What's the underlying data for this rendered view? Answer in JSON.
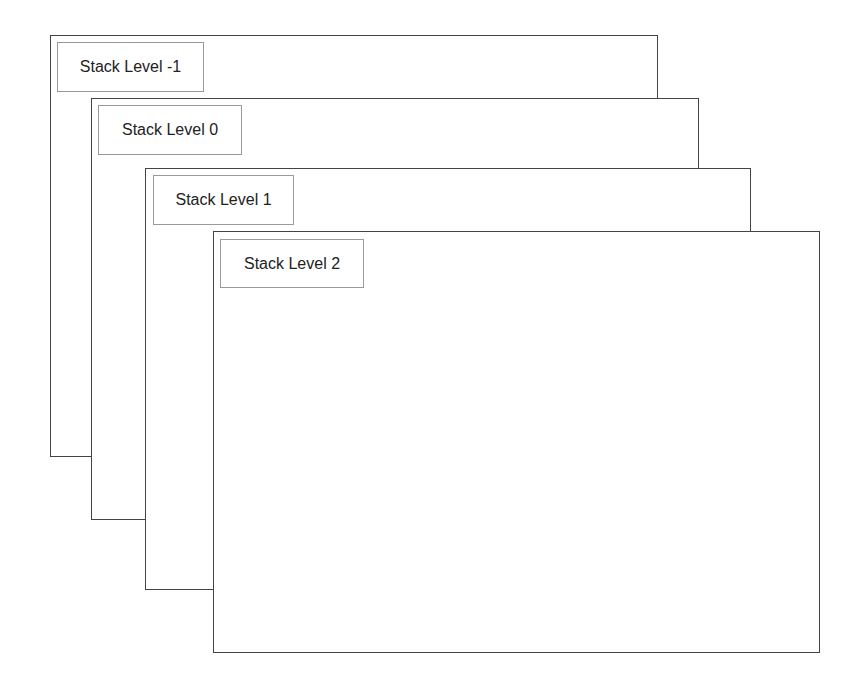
{
  "diagram": {
    "type": "stacked-layers",
    "layers": [
      {
        "level": -1,
        "label": "Stack Level -1"
      },
      {
        "level": 0,
        "label": "Stack Level 0"
      },
      {
        "level": 1,
        "label": "Stack Level 1"
      },
      {
        "level": 2,
        "label": "Stack Level 2"
      }
    ],
    "colors": {
      "layer_border": "#444444",
      "label_border": "#999999",
      "background": "#ffffff",
      "text": "#222222"
    }
  }
}
